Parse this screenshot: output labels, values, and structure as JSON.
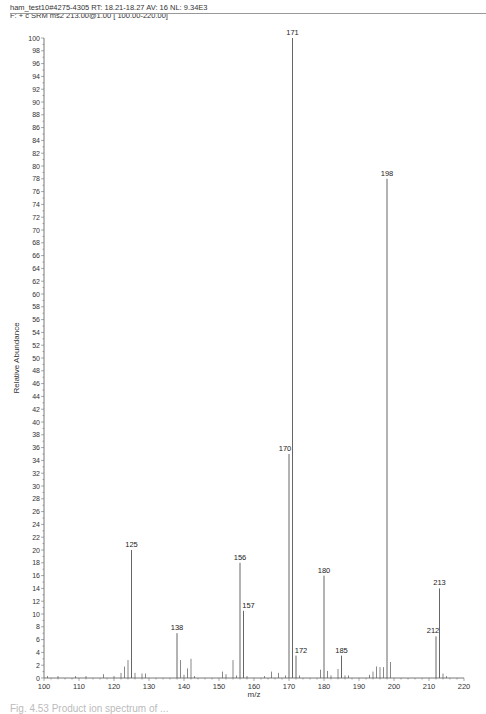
{
  "header": {
    "line1": "ham_test10#4275-4305  RT: 18.21-18.27  AV: 16  NL: 9.34E3",
    "line2": "F: + c SRM ms2 213.00@1.00 [ 100.00-220.00]"
  },
  "caption": "Fig. 4.53 Product ion spectrum of ...",
  "chart_data": {
    "type": "bar",
    "title": "ham_test10#4275-4305 RT: 18.21-18.27 AV: 16 NL: 9.34E3",
    "subtitle": "F: + c SRM ms2 213.00@1.00 [ 100.00-220.00]",
    "xlabel": "m/z",
    "ylabel": "Relative Abundance",
    "xlim": [
      100,
      220
    ],
    "ylim": [
      0,
      100
    ],
    "xticks": [
      100,
      110,
      120,
      130,
      140,
      150,
      160,
      170,
      180,
      190,
      200,
      210,
      220
    ],
    "yticks": [
      0,
      2,
      4,
      6,
      8,
      10,
      12,
      14,
      16,
      18,
      20,
      22,
      24,
      26,
      28,
      30,
      32,
      34,
      36,
      38,
      40,
      42,
      44,
      46,
      48,
      50,
      52,
      54,
      56,
      58,
      60,
      62,
      64,
      66,
      68,
      70,
      72,
      74,
      76,
      78,
      80,
      82,
      84,
      86,
      88,
      90,
      92,
      94,
      96,
      98,
      100
    ],
    "grid": false,
    "labeled_peaks": [
      {
        "mz": 125,
        "intensity": 20
      },
      {
        "mz": 138,
        "intensity": 7
      },
      {
        "mz": 156,
        "intensity": 18
      },
      {
        "mz": 157,
        "intensity": 10.5
      },
      {
        "mz": 170,
        "intensity": 35
      },
      {
        "mz": 171,
        "intensity": 100
      },
      {
        "mz": 172,
        "intensity": 3.5
      },
      {
        "mz": 180,
        "intensity": 16
      },
      {
        "mz": 185,
        "intensity": 3.5
      },
      {
        "mz": 198,
        "intensity": 78
      },
      {
        "mz": 212,
        "intensity": 6.5
      },
      {
        "mz": 213,
        "intensity": 14
      }
    ],
    "minor_peaks": [
      {
        "mz": 101,
        "intensity": 0.3
      },
      {
        "mz": 104,
        "intensity": 0.3
      },
      {
        "mz": 109,
        "intensity": 0.3
      },
      {
        "mz": 112,
        "intensity": 0.3
      },
      {
        "mz": 117,
        "intensity": 0.6
      },
      {
        "mz": 120,
        "intensity": 0.3
      },
      {
        "mz": 122,
        "intensity": 0.8
      },
      {
        "mz": 123,
        "intensity": 1.8
      },
      {
        "mz": 124,
        "intensity": 2.8
      },
      {
        "mz": 126,
        "intensity": 0.8
      },
      {
        "mz": 128,
        "intensity": 0.7
      },
      {
        "mz": 129,
        "intensity": 0.7
      },
      {
        "mz": 139,
        "intensity": 2.8
      },
      {
        "mz": 140,
        "intensity": 0.5
      },
      {
        "mz": 141,
        "intensity": 1.5
      },
      {
        "mz": 142,
        "intensity": 3.0
      },
      {
        "mz": 143,
        "intensity": 0.3
      },
      {
        "mz": 151,
        "intensity": 1.0
      },
      {
        "mz": 152,
        "intensity": 0.6
      },
      {
        "mz": 154,
        "intensity": 2.8
      },
      {
        "mz": 155,
        "intensity": 0.4
      },
      {
        "mz": 158,
        "intensity": 0.3
      },
      {
        "mz": 163,
        "intensity": 0.3
      },
      {
        "mz": 165,
        "intensity": 1.0
      },
      {
        "mz": 167,
        "intensity": 0.8
      },
      {
        "mz": 169,
        "intensity": 0.4
      },
      {
        "mz": 173,
        "intensity": 0.4
      },
      {
        "mz": 179,
        "intensity": 1.3
      },
      {
        "mz": 181,
        "intensity": 1.1
      },
      {
        "mz": 182,
        "intensity": 0.4
      },
      {
        "mz": 184,
        "intensity": 1.4
      },
      {
        "mz": 186,
        "intensity": 0.4
      },
      {
        "mz": 187,
        "intensity": 0.4
      },
      {
        "mz": 193,
        "intensity": 0.5
      },
      {
        "mz": 194,
        "intensity": 1.0
      },
      {
        "mz": 195,
        "intensity": 1.8
      },
      {
        "mz": 196,
        "intensity": 1.7
      },
      {
        "mz": 197,
        "intensity": 1.7
      },
      {
        "mz": 199,
        "intensity": 2.5
      },
      {
        "mz": 214,
        "intensity": 0.7
      },
      {
        "mz": 215,
        "intensity": 0.3
      }
    ]
  },
  "colors": {
    "axis": "#555555",
    "peak": "#555555",
    "text": "#222222"
  }
}
